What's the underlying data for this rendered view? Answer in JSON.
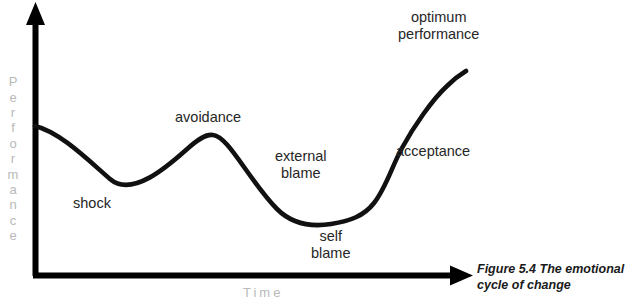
{
  "figure": {
    "caption": "Figure 5.4  The emotional\ncycle of change"
  },
  "axes": {
    "y_title": "Performance",
    "x_title": "Time",
    "axis_color": "#000000",
    "axis_label_color": "#b9b9b9"
  },
  "curve": {
    "color": "#111111",
    "stroke_width": 4.6
  },
  "labels": {
    "shock": "shock",
    "avoidance": "avoidance",
    "external_blame": "external\nblame",
    "self_blame": "self\nblame",
    "acceptance": "acceptance",
    "optimum_performance": "optimum\nperformance"
  },
  "chart_data": {
    "type": "line",
    "title": "Figure 5.4  The emotional cycle of change",
    "xlabel": "Time",
    "ylabel": "Performance",
    "grid": false,
    "legend": false,
    "annotations": [
      {
        "text": "shock",
        "stage": 1,
        "x": 110,
        "y": 180
      },
      {
        "text": "avoidance",
        "stage": 2,
        "x": 212,
        "y": 135
      },
      {
        "text": "external blame",
        "stage": 3,
        "x": 288,
        "y": 190
      },
      {
        "text": "self blame",
        "stage": 4,
        "x": 330,
        "y": 224
      },
      {
        "text": "acceptance",
        "stage": 5,
        "x": 405,
        "y": 150
      },
      {
        "text": "optimum performance",
        "stage": 6,
        "x": 462,
        "y": 72
      }
    ],
    "x": [
      33,
      110,
      212,
      275,
      330,
      380,
      412,
      465
    ],
    "y": [
      126,
      180,
      135,
      186,
      224,
      208,
      140,
      72
    ],
    "points_note": "y values are screen pixels; lower y = higher performance",
    "series": [
      {
        "name": "performance",
        "values": [
          0.62,
          0.26,
          0.57,
          0.23,
          0.0,
          0.11,
          0.56,
          1.0
        ]
      }
    ],
    "ylim": [
      0,
      1
    ],
    "xlim": [
      0,
      1
    ]
  }
}
